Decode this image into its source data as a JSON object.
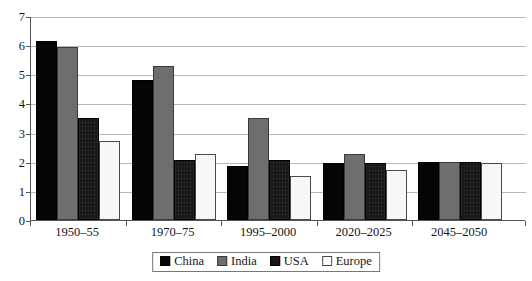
{
  "chart_data": {
    "type": "bar",
    "title": "",
    "subtitle": "",
    "xlabel": "",
    "ylabel": "",
    "ylim": [
      0,
      7
    ],
    "ytick_labels": [
      "0",
      "1",
      "2",
      "3",
      "4",
      "5",
      "6",
      "7"
    ],
    "yticks": [
      0,
      1,
      2,
      3,
      4,
      5,
      6,
      7
    ],
    "grid": true,
    "legend_position": "bottom-center",
    "categories": [
      "1950–55",
      "1970–75",
      "1995–2000",
      "2020–2025",
      "2045–2050"
    ],
    "series": [
      {
        "name": "China",
        "color": "#050505",
        "values": [
          6.15,
          4.8,
          1.85,
          1.95,
          2.0
        ]
      },
      {
        "name": "India",
        "color": "#6e6e6e",
        "values": [
          5.95,
          5.3,
          3.5,
          2.25,
          2.0
        ]
      },
      {
        "name": "USA",
        "color": "#161616",
        "values": [
          3.5,
          2.05,
          2.05,
          1.95,
          2.0
        ]
      },
      {
        "name": "Europe",
        "color": "#f7f7f7",
        "values": [
          2.7,
          2.25,
          1.5,
          1.7,
          1.95
        ]
      }
    ]
  },
  "legend": {
    "items": [
      {
        "label": "China"
      },
      {
        "label": "India"
      },
      {
        "label": "USA"
      },
      {
        "label": "Europe"
      }
    ]
  },
  "axes": {
    "y_axis_name": "value-axis",
    "x_axis_name": "period-axis"
  },
  "colors": {
    "gridline": "#b8b8b8",
    "axis": "#555555",
    "text": "#151515",
    "background": "#ffffff"
  }
}
